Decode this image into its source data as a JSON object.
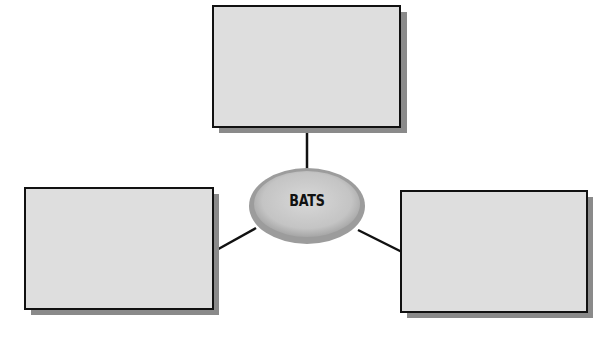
{
  "diagram": {
    "center": {
      "label": "BATS"
    },
    "boxes": [
      {
        "position": "top",
        "text": ""
      },
      {
        "position": "left",
        "text": ""
      },
      {
        "position": "right",
        "text": ""
      }
    ]
  },
  "colors": {
    "box_fill": "#dedede",
    "box_border": "#111111",
    "shadow": "#8a8a8a",
    "ellipse_fill": "#c8c8c8"
  }
}
